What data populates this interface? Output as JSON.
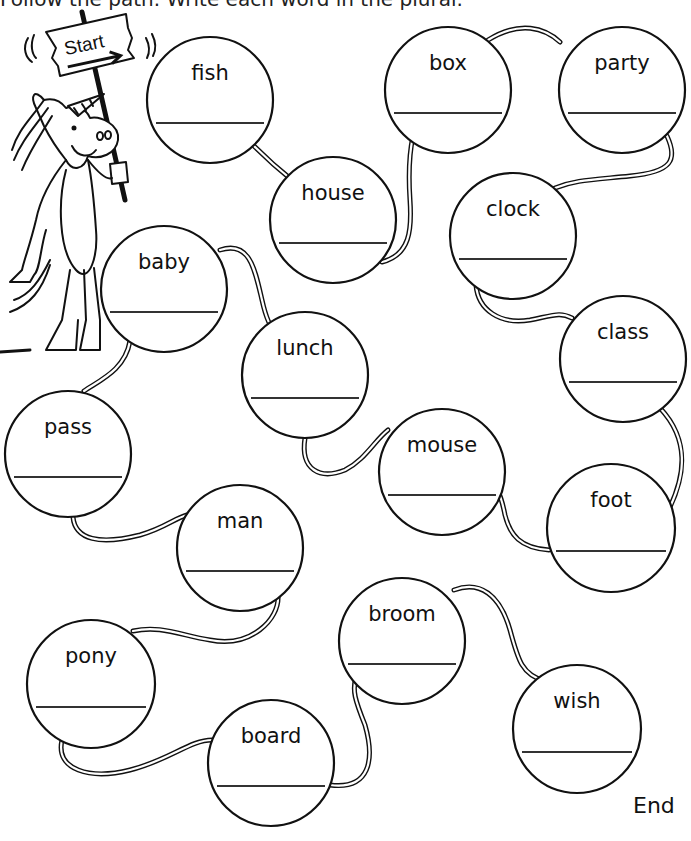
{
  "header": {
    "instruction_cut": "Follow the path. Write each word in the plural."
  },
  "start_sign": {
    "label": "Start"
  },
  "end_label": "End",
  "circles": [
    {
      "word": "fish",
      "cx": 210,
      "cy": 100,
      "r": 63
    },
    {
      "word": "house",
      "cx": 333,
      "cy": 220,
      "r": 63
    },
    {
      "word": "box",
      "cx": 448,
      "cy": 90,
      "r": 63
    },
    {
      "word": "party",
      "cx": 622,
      "cy": 90,
      "r": 63
    },
    {
      "word": "clock",
      "cx": 513,
      "cy": 236,
      "r": 63
    },
    {
      "word": "class",
      "cx": 623,
      "cy": 359,
      "r": 63
    },
    {
      "word": "foot",
      "cx": 611,
      "cy": 528,
      "r": 64
    },
    {
      "word": "mouse",
      "cx": 442,
      "cy": 472,
      "r": 63
    },
    {
      "word": "lunch",
      "cx": 305,
      "cy": 375,
      "r": 63
    },
    {
      "word": "baby",
      "cx": 164,
      "cy": 289,
      "r": 63
    },
    {
      "word": "pass",
      "cx": 68,
      "cy": 454,
      "r": 63
    },
    {
      "word": "man",
      "cx": 240,
      "cy": 548,
      "r": 63
    },
    {
      "word": "pony",
      "cx": 91,
      "cy": 684,
      "r": 64
    },
    {
      "word": "board",
      "cx": 271,
      "cy": 763,
      "r": 63
    },
    {
      "word": "broom",
      "cx": 402,
      "cy": 641,
      "r": 63
    },
    {
      "word": "wish",
      "cx": 577,
      "cy": 729,
      "r": 64
    }
  ],
  "path_order": [
    "fish",
    "house",
    "box",
    "party",
    "clock",
    "class",
    "foot",
    "mouse",
    "lunch",
    "baby",
    "pass",
    "man",
    "pony",
    "board",
    "broom",
    "wish"
  ],
  "connectors": [
    "M254,146 C268,160 282,172 292,180",
    "M382,262 C410,255 412,230 410,200 C408,170 410,150 413,136",
    "M488,40 C520,20 545,28 560,42",
    "M667,136 C678,160 672,172 630,176 C590,180 575,180 555,188",
    "M476,285 C478,310 500,325 530,320 C555,315 560,312 572,318",
    "M660,408 C690,440 685,475 670,507",
    "M549,550 C520,548 510,535 505,515 C502,500 500,495 498,492",
    "M305,438 C300,470 320,480 345,470 C365,460 375,440 388,430",
    "M220,250 C250,240 255,270 262,300 C266,318 270,328 276,332",
    "M130,341 C125,370 100,380 84,391",
    "M73,517 C75,540 100,545 140,535 C165,528 175,518 187,515",
    "M278,595 C280,620 250,648 210,640 C180,635 160,625 133,631",
    "M62,740 C55,770 90,780 130,770 C170,760 190,740 212,740",
    "M330,785 C370,790 375,760 365,725 C355,700 352,690 356,678",
    "M454,590 C480,580 500,595 510,630 C518,660 522,675 545,681"
  ]
}
